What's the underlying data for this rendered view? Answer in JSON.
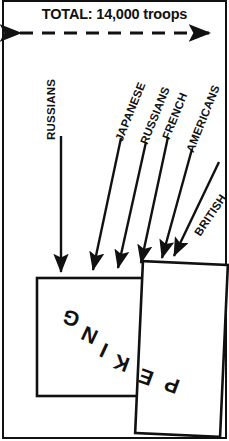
{
  "figure": {
    "title": "TOTAL: 14,000 troops",
    "city_label": "PEKING",
    "city_label_rotation_deg": 200,
    "scale_arrow": {
      "name": "total-troops-span-arrow",
      "style": "dashed double-headed horizontal arrow",
      "y": 33,
      "x_start": 12,
      "x_end": 217
    },
    "colors": {
      "ink": "#111111",
      "paper": "#ffffff"
    },
    "forces": [
      {
        "id": "russians-north",
        "label": "RUSSIANS",
        "label_x": 57,
        "label_y": 128,
        "label_rotation_deg": -90,
        "arrow": {
          "x1": 61,
          "y1": 136,
          "x2": 61,
          "y2": 276
        }
      },
      {
        "id": "japanese",
        "label": "JAPANESE",
        "label_x": 125,
        "label_y": 130,
        "label_rotation_deg": -68,
        "arrow": {
          "x1": 121,
          "y1": 136,
          "x2": 92,
          "y2": 274
        }
      },
      {
        "id": "russians-east",
        "label": "RUSSIANS",
        "label_x": 150,
        "label_y": 133,
        "label_rotation_deg": -68,
        "arrow": {
          "x1": 146,
          "y1": 139,
          "x2": 117,
          "y2": 272
        }
      },
      {
        "id": "french",
        "label": "FRENCH",
        "label_x": 172,
        "label_y": 128,
        "label_rotation_deg": -68,
        "arrow": {
          "x1": 168,
          "y1": 134,
          "x2": 139,
          "y2": 268
        }
      },
      {
        "id": "americans",
        "label": "AMERICANS",
        "label_x": 196,
        "label_y": 140,
        "label_rotation_deg": -68,
        "arrow": {
          "x1": 192,
          "y1": 146,
          "x2": 160,
          "y2": 262
        }
      },
      {
        "id": "british",
        "label": "BRITISH",
        "label_x": 203,
        "label_y": 224,
        "label_rotation_deg": -56,
        "arrow": {
          "x1": 218,
          "y1": 160,
          "x2": 172,
          "y2": 258
        }
      }
    ],
    "city_blocks": [
      {
        "id": "peking-outer-wall",
        "x": 37,
        "y": 278,
        "width": 120,
        "height": 118,
        "rotation_deg": 0
      },
      {
        "id": "peking-inner-wall",
        "x": 139,
        "y": 263,
        "width": 85,
        "height": 172,
        "rotation_deg": 2.5
      }
    ],
    "peking_letters": [
      {
        "ch": "G",
        "x": 63,
        "y": 318,
        "rot": 200
      },
      {
        "ch": "N",
        "x": 82,
        "y": 335,
        "rot": 205
      },
      {
        "ch": "I",
        "x": 99,
        "y": 350,
        "rot": 205
      },
      {
        "ch": "K",
        "x": 116,
        "y": 363,
        "rot": 200
      },
      {
        "ch": "E",
        "x": 140,
        "y": 377,
        "rot": 200
      },
      {
        "ch": "P",
        "x": 166,
        "y": 385,
        "rot": 200
      }
    ]
  }
}
